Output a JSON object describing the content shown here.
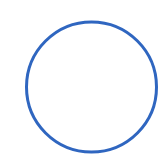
{
  "shape": {
    "type": "circle",
    "icon": "circle-outline",
    "cx": 91.5,
    "cy": 87,
    "r": 65,
    "stroke_width": 3,
    "stroke_color": "#2f66c0",
    "fill": "none"
  },
  "background_color": "#ffffff"
}
